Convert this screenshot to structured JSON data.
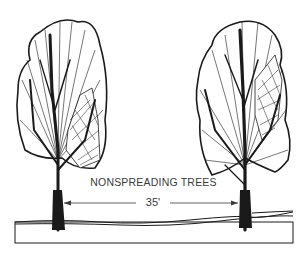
{
  "figure": {
    "caption": "NONSPREADING TREES",
    "dimension_label": "35'",
    "trees": [
      {
        "id": "left",
        "type": "nonspreading-tree",
        "trunk_x": 58
      },
      {
        "id": "right",
        "type": "nonspreading-tree",
        "trunk_x": 245
      }
    ],
    "colors": {
      "ink": "#1a1a1a",
      "paper": "#ffffff",
      "text": "#3a3a3a"
    }
  }
}
